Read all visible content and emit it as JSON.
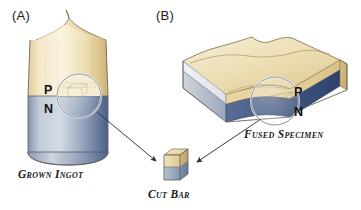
{
  "figure": {
    "width": 361,
    "height": 210,
    "background": "#ffffff",
    "type": "scientific-diagram"
  },
  "panels": [
    {
      "id": "a",
      "label": "(A)",
      "caption": "Grown Ingot",
      "shape": "cylindrical-ingot-with-conical-top",
      "layers": [
        {
          "region": "P",
          "label": "P",
          "color": "#e9d7a8",
          "position": "upper"
        },
        {
          "region": "N",
          "label": "N",
          "color": "#7e90ae",
          "position": "lower"
        }
      ],
      "magnifier": {
        "shape": "circle",
        "cx": 79,
        "cy": 96,
        "r": 22,
        "contains": "dashed-cut-bar-outline"
      }
    },
    {
      "id": "b",
      "label": "(B)",
      "caption": "Fused Specimen",
      "shape": "rectangular-slab-isometric",
      "layers": [
        {
          "region": "P",
          "label": "P",
          "color": "#e9d7a8",
          "position": "upper"
        },
        {
          "region": "N",
          "label": "N",
          "color": "#3f5680",
          "position": "lower"
        }
      ],
      "magnifier": {
        "shape": "circle",
        "cx": 275,
        "cy": 101,
        "r": 24,
        "contains": "dashed-cut-bar-outline"
      }
    }
  ],
  "product": {
    "label": "Cut Bar",
    "shape": "isometric-cube",
    "layers": [
      {
        "region": "P",
        "color": "#e9d7a8"
      },
      {
        "region": "N",
        "color": "#8e9fba"
      }
    ]
  },
  "arrows": [
    {
      "name": "ingot-to-cutbar",
      "from": "panel-a-magnifier",
      "to": "cut-bar",
      "x1": 98,
      "y1": 114,
      "x2": 155,
      "y2": 160
    },
    {
      "name": "specimen-to-cutbar",
      "from": "panel-b-magnifier",
      "to": "cut-bar",
      "x1": 260,
      "y1": 119,
      "x2": 196,
      "y2": 161
    }
  ],
  "colors": {
    "p_tan_light": "#f6eccd",
    "p_tan": "#e9d7a8",
    "p_tan_dark": "#d2b874",
    "n_blue_light": "#b9c3d2",
    "n_blue": "#7e90ae",
    "n_blue_dark": "#3f5680",
    "outline": "#4a4a4a",
    "text": "#1a1a1a",
    "background": "#ffffff"
  }
}
